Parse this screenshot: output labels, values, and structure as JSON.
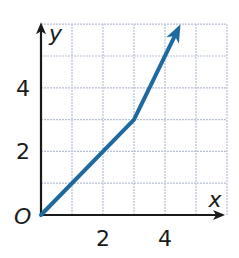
{
  "chart_data": {
    "type": "line",
    "title": "",
    "xlabel": "x",
    "ylabel": "y",
    "origin_label": "O",
    "x_ticks": [
      2,
      4
    ],
    "y_ticks": [
      2,
      4
    ],
    "x_tick_labels": [
      "2",
      "4"
    ],
    "y_tick_labels": [
      "2",
      "4"
    ],
    "xlim": [
      0,
      6
    ],
    "ylim": [
      0,
      6
    ],
    "grid": true,
    "series": [
      {
        "name": "piecewise",
        "color": "#1e6aa0",
        "x": [
          0,
          3,
          4.5
        ],
        "y": [
          0,
          3,
          6
        ],
        "end_arrow": true
      }
    ]
  },
  "colors": {
    "grid": "#b7bfd6",
    "axis": "#1a1a1a",
    "line": "#1e6aa0"
  }
}
